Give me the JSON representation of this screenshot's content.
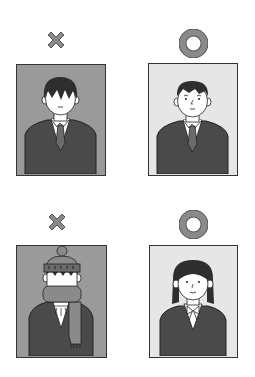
{
  "colors": {
    "marker": "#8a8a8a",
    "marker_outline": "#555555",
    "bad_bg": "#9a9a9a",
    "good_bg": "#e6e6e6",
    "suit": "#4a4a4a",
    "tie": "#6b6b6b",
    "hair": "#2e2e2e",
    "skin": "#ffffff",
    "line": "#222222"
  },
  "photos": [
    {
      "id": "top-left",
      "verdict": "bad",
      "marker_symbol": "✕",
      "marker_label": "Incorrect",
      "description": "Man with hair covering eyes, dark background"
    },
    {
      "id": "top-right",
      "verdict": "good",
      "marker_symbol": "○",
      "marker_label": "Correct",
      "description": "Man with short hair, face visible, light background"
    },
    {
      "id": "bottom-left",
      "verdict": "bad",
      "marker_symbol": "✕",
      "marker_label": "Incorrect",
      "description": "Person wearing knit hat and scarf covering face, dark background"
    },
    {
      "id": "bottom-right",
      "verdict": "good",
      "marker_symbol": "○",
      "marker_label": "Correct",
      "description": "Woman with hair tied, face visible, light background"
    }
  ]
}
